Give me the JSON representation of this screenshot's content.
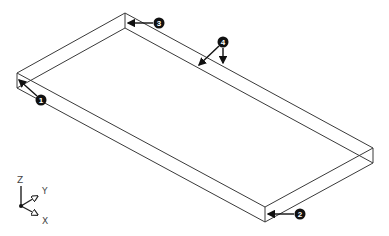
{
  "figure": {
    "box": {
      "top_face": [
        [
          17,
          73
        ],
        [
          125,
          13
        ],
        [
          373,
          148
        ],
        [
          265,
          207
        ]
      ],
      "thickness_px": 15
    },
    "callouts": [
      {
        "id": "1",
        "label": "1",
        "cx": 41,
        "cy": 100,
        "targets": [
          [
            19,
            80
          ]
        ]
      },
      {
        "id": "2",
        "label": "2",
        "cx": 300,
        "cy": 214,
        "targets": [
          [
            268,
            214
          ]
        ]
      },
      {
        "id": "3",
        "label": "3",
        "cx": 159,
        "cy": 23,
        "targets": [
          [
            128,
            23
          ]
        ]
      },
      {
        "id": "4",
        "label": "4",
        "cx": 223,
        "cy": 42,
        "targets": [
          [
            199,
            65
          ],
          [
            223,
            63
          ]
        ]
      }
    ],
    "axes": {
      "origin": [
        21,
        206
      ],
      "labels": {
        "z": "Z",
        "y": "Y",
        "x": "X"
      }
    }
  },
  "colors": {
    "edge": "#3a3a3a",
    "callout": "#111111",
    "background": "#ffffff"
  }
}
